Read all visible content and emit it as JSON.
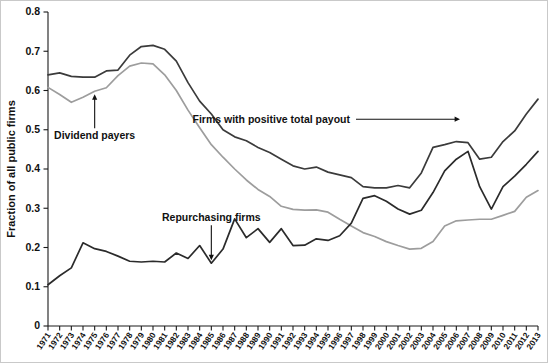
{
  "chart_data": {
    "type": "line",
    "title": "",
    "xlabel": "",
    "ylabel": "Fraction of all public firms",
    "ylim": [
      0,
      0.8
    ],
    "ytick_values": [
      0,
      0.1,
      0.2,
      0.3,
      0.4,
      0.5,
      0.6,
      0.7,
      0.8
    ],
    "ytick_labels": [
      "0",
      "0.1",
      "0.2",
      "0.3",
      "0.4",
      "0.5",
      "0.6",
      "0.7",
      "0.8"
    ],
    "grid": false,
    "legend_position": "inline-annotations",
    "x": [
      1971,
      1972,
      1973,
      1974,
      1975,
      1976,
      1977,
      1978,
      1979,
      1980,
      1981,
      1982,
      1983,
      1984,
      1985,
      1986,
      1987,
      1988,
      1989,
      1990,
      1991,
      1992,
      1993,
      1994,
      1995,
      1996,
      1997,
      1998,
      1999,
      2000,
      2001,
      2002,
      2003,
      2004,
      2005,
      2006,
      2007,
      2008,
      2009,
      2010,
      2011,
      2012,
      2013
    ],
    "xtick_labels": [
      "1971",
      "1972",
      "1973",
      "1974",
      "1975",
      "1976",
      "1977",
      "1978",
      "1979",
      "1980",
      "1981",
      "1982",
      "1983",
      "1984",
      "1985",
      "1986",
      "1987",
      "1988",
      "1989",
      "1990",
      "1991",
      "1992",
      "1993",
      "1994",
      "1995",
      "1996",
      "1997",
      "1998",
      "1999",
      "2000",
      "2001",
      "2002",
      "2003",
      "2004",
      "2005",
      "2006",
      "2007",
      "2008",
      "2009",
      "2010",
      "2011",
      "2012",
      "2013"
    ],
    "series": [
      {
        "name": "Firms with positive total payout",
        "color": "#3b3b3b",
        "width": 1.7,
        "values": [
          0.64,
          0.645,
          0.636,
          0.634,
          0.634,
          0.65,
          0.652,
          0.69,
          0.712,
          0.715,
          0.705,
          0.675,
          0.62,
          0.573,
          0.54,
          0.5,
          0.482,
          0.472,
          0.455,
          0.442,
          0.425,
          0.408,
          0.4,
          0.405,
          0.392,
          0.385,
          0.378,
          0.355,
          0.352,
          0.352,
          0.358,
          0.352,
          0.39,
          0.455,
          0.462,
          0.47,
          0.467,
          0.425,
          0.43,
          0.47,
          0.497,
          0.54,
          0.578
        ]
      },
      {
        "name": "Dividend payers",
        "color": "#9d9d9d",
        "width": 1.7,
        "values": [
          0.608,
          0.59,
          0.57,
          0.583,
          0.598,
          0.607,
          0.638,
          0.662,
          0.67,
          0.668,
          0.64,
          0.6,
          0.55,
          0.505,
          0.462,
          0.43,
          0.4,
          0.372,
          0.348,
          0.33,
          0.305,
          0.297,
          0.295,
          0.296,
          0.29,
          0.272,
          0.255,
          0.238,
          0.228,
          0.215,
          0.205,
          0.196,
          0.198,
          0.215,
          0.255,
          0.268,
          0.27,
          0.272,
          0.272,
          0.282,
          0.292,
          0.328,
          0.345
        ]
      },
      {
        "name": "Repurchasing firms",
        "color": "#2b2b2b",
        "width": 1.7,
        "values": [
          0.105,
          0.128,
          0.148,
          0.212,
          0.197,
          0.19,
          0.178,
          0.165,
          0.163,
          0.165,
          0.163,
          0.186,
          0.172,
          0.205,
          0.16,
          0.196,
          0.273,
          0.225,
          0.248,
          0.213,
          0.248,
          0.205,
          0.206,
          0.222,
          0.218,
          0.23,
          0.262,
          0.325,
          0.332,
          0.318,
          0.298,
          0.285,
          0.295,
          0.34,
          0.395,
          0.425,
          0.445,
          0.355,
          0.298,
          0.355,
          0.382,
          0.412,
          0.445
        ]
      }
    ],
    "annotations": [
      {
        "id": "dividend-payers",
        "text": "Dividend payers",
        "series": "Dividend payers",
        "points_to_year": 1975,
        "arrow_direction": "up"
      },
      {
        "id": "repurchasing-firms",
        "text": "Repurchasing firms",
        "series": "Repurchasing firms",
        "points_to_year": 1985,
        "arrow_direction": "down"
      },
      {
        "id": "positive-total-payout",
        "text": "Firms with positive total payout",
        "series": "Firms with positive total payout",
        "points_to_year": 2007,
        "arrow_direction": "right"
      }
    ]
  }
}
